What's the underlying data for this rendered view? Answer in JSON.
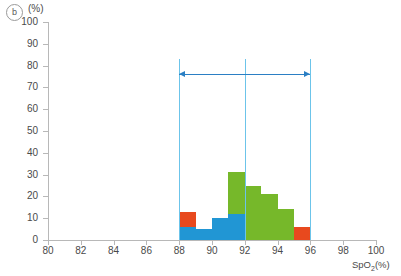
{
  "panel": {
    "tag": "b"
  },
  "axes": {
    "y_unit": "(%)",
    "x_title_main": "SpO",
    "x_title_sub": "2",
    "x_title_unit": "(%)",
    "y_ticks": [
      "0",
      "10",
      "20",
      "30",
      "40",
      "50",
      "60",
      "70",
      "80",
      "90",
      "100"
    ],
    "x_ticks": [
      "80",
      "82",
      "84",
      "86",
      "88",
      "90",
      "92",
      "94",
      "96",
      "98",
      "100"
    ]
  },
  "colors": {
    "blue": "#2196d4",
    "green": "#76b82a",
    "orange": "#e8491e",
    "refline": "#6cc4ea",
    "arrow": "#2b7fc4",
    "axis": "#b8b8b8",
    "text": "#4a4a4a"
  },
  "annotations": {
    "reference_lines_x": [
      88,
      92,
      96
    ],
    "span_arrow": {
      "from": 88,
      "to": 96,
      "y": 76,
      "double_headed": true
    }
  },
  "chart_data": {
    "type": "bar",
    "title": "",
    "subtitle": "",
    "xlabel": "SpO2(%)",
    "ylabel": "(%)",
    "xlim": [
      80,
      100
    ],
    "ylim": [
      0,
      100
    ],
    "x_tick_step": 2,
    "y_tick_step": 10,
    "grid": false,
    "legend": null,
    "bin_width": 1,
    "stacked": true,
    "bins": [
      {
        "x0": 88,
        "x1": 89,
        "segments": [
          {
            "color": "blue",
            "value": 6
          },
          {
            "color": "orange",
            "value": 7
          }
        ]
      },
      {
        "x0": 89,
        "x1": 90,
        "segments": [
          {
            "color": "blue",
            "value": 5
          }
        ]
      },
      {
        "x0": 90,
        "x1": 91,
        "segments": [
          {
            "color": "blue",
            "value": 10
          }
        ]
      },
      {
        "x0": 91,
        "x1": 92,
        "segments": [
          {
            "color": "blue",
            "value": 12
          },
          {
            "color": "green",
            "value": 19
          }
        ]
      },
      {
        "x0": 92,
        "x1": 93,
        "segments": [
          {
            "color": "green",
            "value": 25
          }
        ]
      },
      {
        "x0": 93,
        "x1": 94,
        "segments": [
          {
            "color": "green",
            "value": 21
          }
        ]
      },
      {
        "x0": 94,
        "x1": 95,
        "segments": [
          {
            "color": "green",
            "value": 14
          }
        ]
      },
      {
        "x0": 95,
        "x1": 96,
        "segments": [
          {
            "color": "orange",
            "value": 6
          }
        ]
      }
    ],
    "bar_totals": [
      13,
      5,
      10,
      31,
      25,
      21,
      14,
      6
    ]
  }
}
